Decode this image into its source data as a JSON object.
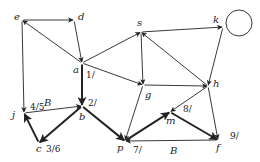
{
  "diagram": {
    "type": "directed-graph",
    "colors": {
      "stroke": "#222222",
      "background": "#ffffff"
    },
    "nodes": [
      {
        "id": "e",
        "label": "e",
        "x": 22,
        "y": 20,
        "lx": 14,
        "ly": 20
      },
      {
        "id": "d",
        "label": "d",
        "x": 74,
        "y": 20,
        "lx": 78,
        "ly": 20
      },
      {
        "id": "a",
        "label": "a",
        "x": 82,
        "y": 63,
        "lx": 73,
        "ly": 73
      },
      {
        "id": "s",
        "label": "s",
        "x": 141,
        "y": 32,
        "lx": 137,
        "ly": 26
      },
      {
        "id": "k",
        "label": "k",
        "x": 223,
        "y": 27,
        "lx": 213,
        "ly": 23
      },
      {
        "id": "j",
        "label": "j",
        "x": 24,
        "y": 113,
        "lx": 12,
        "ly": 118
      },
      {
        "id": "b",
        "label": "b",
        "x": 82,
        "y": 106,
        "lx": 79,
        "ly": 120
      },
      {
        "id": "g",
        "label": "g",
        "x": 143,
        "y": 85,
        "lx": 145,
        "ly": 98
      },
      {
        "id": "h",
        "label": "h",
        "x": 208,
        "y": 86,
        "lx": 213,
        "ly": 87
      },
      {
        "id": "c",
        "label": "c",
        "x": 39,
        "y": 143,
        "lx": 36,
        "ly": 152
      },
      {
        "id": "p",
        "label": "p",
        "x": 125,
        "y": 141,
        "lx": 117,
        "ly": 151
      },
      {
        "id": "m",
        "label": "m",
        "x": 170,
        "y": 112,
        "lx": 166,
        "ly": 124
      },
      {
        "id": "f",
        "label": "f",
        "x": 218,
        "y": 140,
        "lx": 216,
        "ly": 151
      }
    ],
    "self_loop": {
      "node": "k",
      "cx": 239,
      "cy": 23,
      "r": 13
    },
    "edges": [
      {
        "from": "e",
        "to": "d",
        "weight": "thin",
        "label": ""
      },
      {
        "from": "d",
        "to": "a",
        "weight": "thin",
        "label": ""
      },
      {
        "from": "a",
        "to": "e",
        "weight": "thin",
        "label": ""
      },
      {
        "from": "e",
        "to": "j",
        "weight": "thin",
        "label": ""
      },
      {
        "from": "a",
        "to": "s",
        "weight": "thin",
        "label": ""
      },
      {
        "from": "a",
        "to": "g",
        "weight": "thin",
        "label": ""
      },
      {
        "from": "a",
        "to": "b",
        "weight": "thick",
        "label": ""
      },
      {
        "from": "s",
        "to": "k",
        "weight": "thin",
        "label": ""
      },
      {
        "from": "k",
        "to": "h",
        "weight": "thin",
        "label": ""
      },
      {
        "from": "h",
        "to": "s",
        "weight": "thin",
        "label": ""
      },
      {
        "from": "s",
        "to": "g",
        "weight": "thin",
        "label": ""
      },
      {
        "from": "g",
        "to": "h",
        "weight": "thin",
        "label": ""
      },
      {
        "from": "g",
        "to": "p",
        "weight": "thin",
        "label": ""
      },
      {
        "from": "h",
        "to": "m",
        "weight": "thin",
        "label": ""
      },
      {
        "from": "h",
        "to": "f",
        "weight": "thin",
        "label": ""
      },
      {
        "from": "j",
        "to": "b",
        "weight": "thin",
        "label": "B"
      },
      {
        "from": "b",
        "to": "c",
        "weight": "thick",
        "label": ""
      },
      {
        "from": "c",
        "to": "j",
        "weight": "thick",
        "label": ""
      },
      {
        "from": "b",
        "to": "p",
        "weight": "thick",
        "label": ""
      },
      {
        "from": "p",
        "to": "m",
        "weight": "thick",
        "label": ""
      },
      {
        "from": "m",
        "to": "f",
        "weight": "thick",
        "label": ""
      },
      {
        "from": "f",
        "to": "p",
        "weight": "thin",
        "label": "B"
      }
    ],
    "annotations": [
      {
        "text": "1/",
        "x": 86,
        "y": 78
      },
      {
        "text": "2/",
        "x": 88,
        "y": 106
      },
      {
        "text": "4/5",
        "x": 30,
        "y": 110
      },
      {
        "text": "3/6",
        "x": 46,
        "y": 152
      },
      {
        "text": "7/",
        "x": 133,
        "y": 153
      },
      {
        "text": "8/",
        "x": 183,
        "y": 112
      },
      {
        "text": "9/",
        "x": 230,
        "y": 139
      }
    ],
    "edge_labels": [
      {
        "text": "B",
        "x": 44,
        "y": 106
      },
      {
        "text": "B",
        "x": 170,
        "y": 154
      }
    ]
  }
}
